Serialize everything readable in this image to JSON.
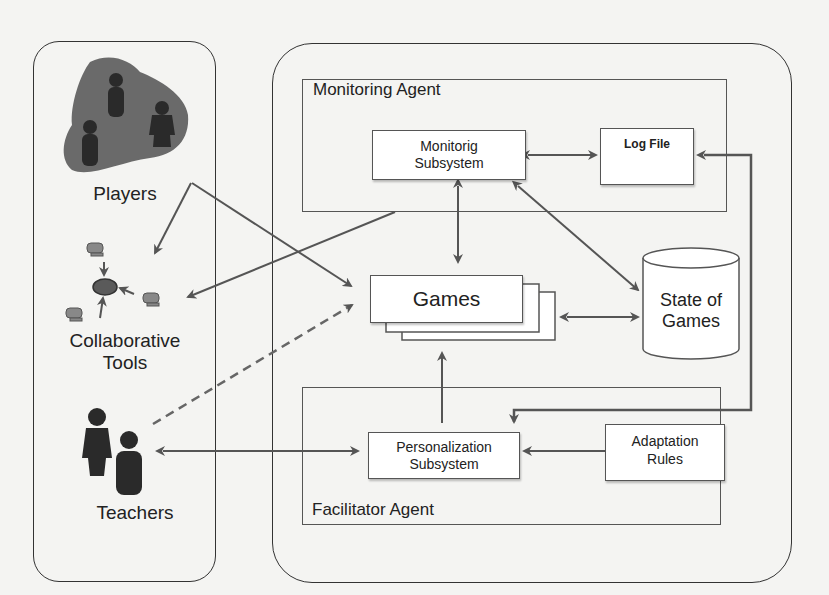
{
  "left_panel": {
    "players": {
      "label": "Players",
      "icon": "players-group-icon"
    },
    "collaborative_tools": {
      "label_line1": "Collaborative",
      "label_line2": "Tools",
      "icon": "network-computers-icon"
    },
    "teachers": {
      "label": "Teachers",
      "icon": "teachers-icon"
    }
  },
  "monitoring_agent": {
    "title": "Monitoring Agent",
    "subsystem": {
      "line1": "Monitorig",
      "line2": "Subsystem"
    },
    "log_file": {
      "label": "Log File"
    }
  },
  "games": {
    "label": "Games"
  },
  "state_of_games": {
    "line1": "State of",
    "line2": "Games"
  },
  "facilitator_agent": {
    "title": "Facilitator Agent",
    "subsystem": {
      "line1": "Personalization",
      "line2": "Subsystem"
    },
    "adaptation_rules": {
      "line1": "Adaptation",
      "line2": "Rules"
    }
  },
  "colors": {
    "line": "#555555",
    "border": "#333333",
    "background": "#f4f4f2",
    "players_blob": "#6a6a6a",
    "figure": "#2a2a2a"
  }
}
